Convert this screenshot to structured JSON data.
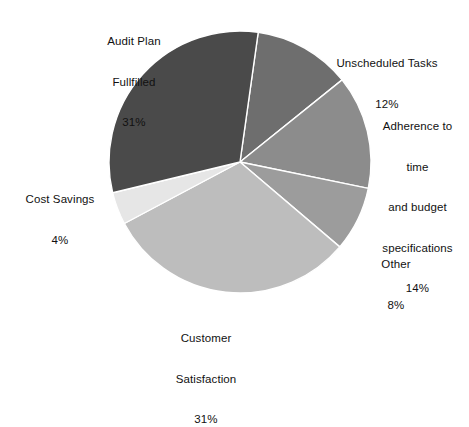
{
  "chart_data": {
    "type": "pie",
    "title": "",
    "subtitle": "",
    "xlabel": "",
    "ylabel": "",
    "legend_position": "none",
    "grid": false,
    "units": "percent",
    "start_angle_deg": 8,
    "direction": "clockwise",
    "categories": [
      "Unscheduled Tasks",
      "Adherence to time and budget specifications",
      "Other",
      "Customer Satisfaction",
      "Cost Savings",
      "Audit Plan Fullfilled"
    ],
    "values": [
      12,
      14,
      8,
      31,
      4,
      31
    ],
    "colors": [
      "#6e6e6e",
      "#8c8c8c",
      "#9c9c9c",
      "#bdbdbd",
      "#e6e6e6",
      "#4a4a4a"
    ],
    "slices": [
      {
        "id": "unscheduled-tasks",
        "name": "Unscheduled Tasks",
        "value": 12,
        "value_label": "12%",
        "color": "#6e6e6e",
        "label_lines": [
          "Unscheduled Tasks"
        ]
      },
      {
        "id": "adherence",
        "name": "Adherence to time and budget specifications",
        "value": 14,
        "value_label": "14%",
        "color": "#8c8c8c",
        "label_lines": [
          "Adherence to",
          "time",
          "and budget",
          "specifications"
        ]
      },
      {
        "id": "other",
        "name": "Other",
        "value": 8,
        "value_label": "8%",
        "color": "#9c9c9c",
        "label_lines": [
          "Other"
        ]
      },
      {
        "id": "customer-satisfaction",
        "name": "Customer Satisfaction",
        "value": 31,
        "value_label": "31%",
        "color": "#bdbdbd",
        "label_lines": [
          "Customer",
          "Satisfaction"
        ]
      },
      {
        "id": "cost-savings",
        "name": "Cost Savings",
        "value": 4,
        "value_label": "4%",
        "color": "#e6e6e6",
        "label_lines": [
          "Cost Savings"
        ]
      },
      {
        "id": "audit-plan-fullfilled",
        "name": "Audit Plan Fullfilled",
        "value": 31,
        "value_label": "31%",
        "color": "#4a4a4a",
        "label_lines": [
          "Audit Plan",
          "Fullfilled"
        ]
      }
    ],
    "geometry": {
      "center_x": 240,
      "center_y": 162,
      "radius": 131,
      "separator_color": "#ffffff",
      "separator_width": 1.4,
      "background": "#ffffff"
    }
  },
  "labels": {
    "audit": {
      "l1": "Audit Plan",
      "l2": "Fullfilled",
      "pct": "31%"
    },
    "unscheduled": {
      "l1": "Unscheduled Tasks",
      "pct": "12%"
    },
    "adherence": {
      "l1": "Adherence to",
      "l2": "time",
      "l3": "and budget",
      "l4": "specifications",
      "pct": "14%"
    },
    "other": {
      "l1": "Other",
      "pct": "8%"
    },
    "customer": {
      "l1": "Customer",
      "l2": "Satisfaction",
      "pct": "31%"
    },
    "cost": {
      "l1": "Cost Savings",
      "pct": "4%"
    }
  }
}
